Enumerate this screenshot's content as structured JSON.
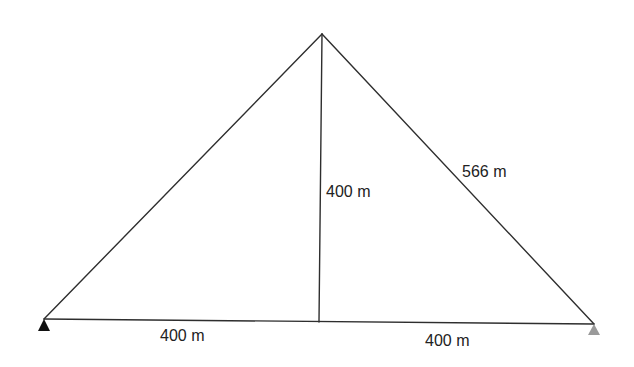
{
  "diagram": {
    "type": "truss-triangle",
    "nodes": {
      "apex": {
        "x": 322,
        "y": 34
      },
      "left_support": {
        "x": 44,
        "y": 319
      },
      "right_support": {
        "x": 594,
        "y": 324
      },
      "mid_bottom": {
        "x": 319,
        "y": 322
      }
    },
    "supports": [
      {
        "name": "left-support",
        "kind": "pin",
        "color": "#111111"
      },
      {
        "name": "right-support",
        "kind": "roller",
        "color": "#9a9a9a"
      }
    ],
    "labels": {
      "bottom_left_span": "400 m",
      "bottom_right_span": "400 m",
      "vertical_height": "400 m",
      "right_diagonal": "566 m"
    },
    "colors": {
      "line": "#2e2e2e",
      "text": "#222222",
      "left_support": "#111111",
      "right_support": "#9a9a9a"
    }
  }
}
